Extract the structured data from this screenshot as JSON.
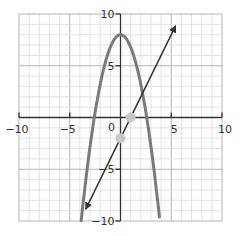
{
  "chart_data": {
    "type": "line",
    "title": "",
    "xlabel": "",
    "ylabel": "",
    "xlim": [
      -10,
      10
    ],
    "ylim": [
      -10,
      10
    ],
    "grid": true,
    "grid_step": 1,
    "x_ticks": [
      -10,
      -5,
      0,
      5,
      10
    ],
    "x_tick_labels": [
      "−10",
      "−5",
      "0",
      "5",
      "10"
    ],
    "y_ticks": [
      10,
      5,
      -5,
      -10
    ],
    "y_tick_labels": [
      "10",
      "5",
      "−5",
      "−10"
    ],
    "series": [
      {
        "name": "parabola",
        "equation": "y = -1.2x^2 + 8",
        "color": "#7a7a7a",
        "stroke_width": 3,
        "x": [
          -3.87,
          -3.5,
          -3,
          -2.5,
          -2,
          -1.5,
          -1,
          -0.5,
          0,
          0.5,
          1,
          1.5,
          2,
          2.5,
          3,
          3.5,
          3.87
        ],
        "y": [
          -10,
          -6.7,
          -2.8,
          0.5,
          3.2,
          5.3,
          6.8,
          7.7,
          8,
          7.7,
          6.8,
          5.3,
          3.2,
          0.5,
          -2.8,
          -6.7,
          -10
        ]
      },
      {
        "name": "line",
        "equation": "y = 2x - 2",
        "color": "#333333",
        "stroke_width": 1.5,
        "arrows": "both",
        "x": [
          -3.4,
          5.4
        ],
        "y": [
          -8.8,
          8.8
        ]
      }
    ],
    "points": [
      {
        "label": "intersection-x",
        "x": 1,
        "y": 0,
        "color": "#c8c8c8"
      },
      {
        "label": "intercept-y",
        "x": 0,
        "y": -2,
        "color": "#c8c8c8"
      }
    ]
  },
  "colors": {
    "grid_minor": "#dcdcdc",
    "grid_major": "#b4b4b4",
    "axis": "#333333",
    "background": "#ffffff"
  }
}
